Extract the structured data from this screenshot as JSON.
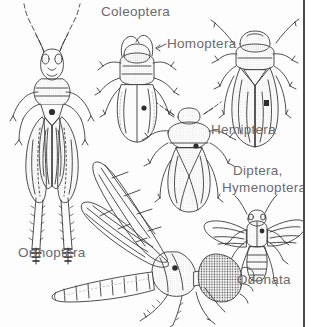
{
  "figure": {
    "type": "scientific-line-illustration",
    "background_color": "#fdfdfd",
    "ink_color": "#3a3a3a",
    "label_color": "#6b6b6b",
    "rule_color": "#4a4a4a"
  },
  "labels": {
    "coleoptera": "Coleoptera",
    "homoptera": "Homoptera",
    "hemiptera": "Hemiptera",
    "diptera": "Diptera,",
    "hymenoptera": "Hymenoptera",
    "orthoptera": "Orthoptera",
    "odonata": "Odonata"
  },
  "specimens": [
    {
      "order": "Orthoptera",
      "common_name": "grasshopper",
      "view": "dorsal",
      "position": "upper-left",
      "features": [
        "long filiform antennae",
        "compound eyes",
        "pronotum",
        "folded tegmina",
        "enlarged hind femora",
        "spined hind tibiae",
        "tarsi"
      ]
    },
    {
      "order": "Coleoptera",
      "common_name": "beetle",
      "view": "dorsal",
      "position": "upper-middle",
      "features": [
        "curved antennae",
        "pronotum",
        "elytra with median suture",
        "three pairs of legs"
      ]
    },
    {
      "order": "Homoptera",
      "common_name": "leafhopper",
      "view": "dorsal",
      "position": "upper-right",
      "features": [
        "short antennae",
        "tapering tented wings",
        "stippled texture",
        "spined legs"
      ]
    },
    {
      "order": "Hemiptera",
      "common_name": "stink bug",
      "view": "dorsal",
      "position": "center",
      "features": [
        "shield-shaped body",
        "triangular scutellum",
        "crossed hemelytra",
        "segmented antennae"
      ]
    },
    {
      "order": "Diptera, Hymenoptera",
      "common_name": "fly",
      "view": "dorsal",
      "position": "right",
      "features": [
        "two outspread veined wings",
        "large head",
        "banded abdomen",
        "bristled legs"
      ]
    },
    {
      "order": "Odonata",
      "common_name": "dragonfly",
      "view": "lateral",
      "position": "bottom",
      "features": [
        "two long veined wings",
        "very large stippled compound eye",
        "robust thorax",
        "long segmented abdomen",
        "spined legs"
      ]
    }
  ]
}
